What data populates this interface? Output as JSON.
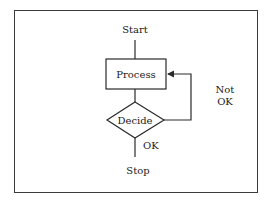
{
  "diagram": {
    "type": "flowchart",
    "nodes": {
      "start": {
        "label": "Start",
        "shape": "terminal-text"
      },
      "process": {
        "label": "Process",
        "shape": "rectangle"
      },
      "decide": {
        "label": "Decide",
        "shape": "diamond"
      },
      "stop": {
        "label": "Stop",
        "shape": "terminal-text"
      }
    },
    "edges": {
      "ok_label": "OK",
      "not_ok_line1": "Not",
      "not_ok_line2": "OK"
    },
    "colors": {
      "stroke": "#2a2a2a",
      "background": "#ffffff",
      "text": "#1a1a1a"
    }
  }
}
